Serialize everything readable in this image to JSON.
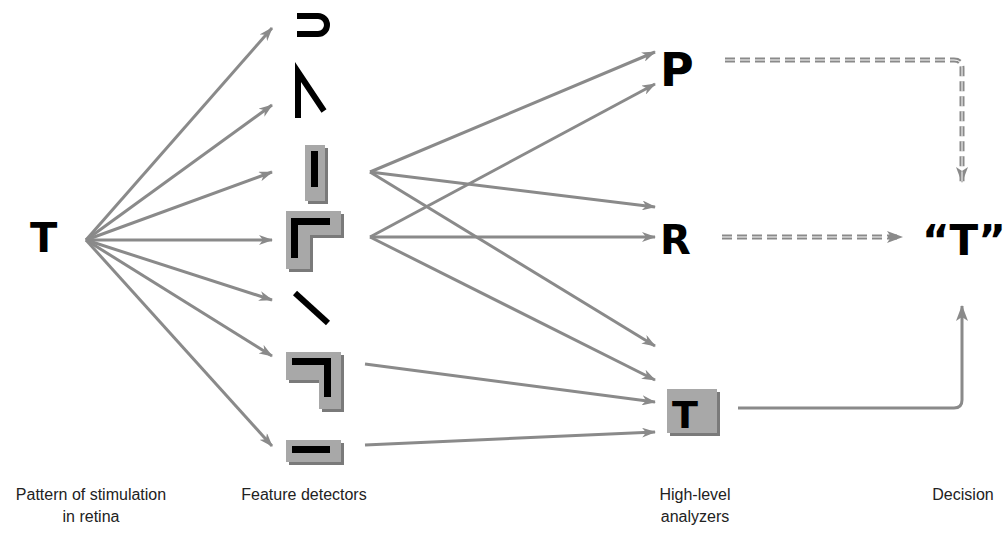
{
  "stages": {
    "retina": {
      "label_line1": "Pattern of stimulation",
      "label_line2": "in retina",
      "stimulus": "T"
    },
    "features": {
      "label": "Feature detectors",
      "detectors": [
        {
          "name": "curve",
          "highlighted": false
        },
        {
          "name": "diagonal-angle",
          "highlighted": false
        },
        {
          "name": "vertical-bar",
          "highlighted": true
        },
        {
          "name": "corner-top-left",
          "highlighted": true
        },
        {
          "name": "diagonal-line",
          "highlighted": false
        },
        {
          "name": "corner-top-right",
          "highlighted": true
        },
        {
          "name": "horizontal-bar",
          "highlighted": true
        }
      ]
    },
    "analyzers": {
      "label_line1": "High-level",
      "label_line2": "analyzers",
      "items": [
        {
          "letter": "P",
          "highlighted": false
        },
        {
          "letter": "R",
          "highlighted": false
        },
        {
          "letter": "T",
          "highlighted": true
        }
      ]
    },
    "decision": {
      "label": "Decision",
      "output": "“T”"
    }
  },
  "colors": {
    "arrow": "#8a8a8a",
    "highlight_box": "#a8a8a8",
    "highlight_shadow": "#7a7a7a",
    "ink": "#000000"
  }
}
